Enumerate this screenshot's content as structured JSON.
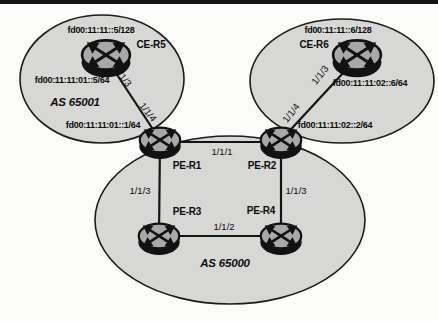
{
  "figure": {
    "type": "network-topology-diagram",
    "description_visible_text_only": true
  },
  "colors": {
    "zone_fill": "#d7d7d5",
    "zone_stroke": "#1b1b1b",
    "router_top_fill": "#a8a8a6",
    "router_base_fill": "#121212",
    "link_stroke": "#141414",
    "text": "#0c0c0c",
    "top_bar": "#141414",
    "background": "#fbfbfa"
  },
  "zones": {
    "as65001": {
      "label": "AS 65001"
    },
    "as65000": {
      "label": "AS 65000"
    }
  },
  "routers": {
    "ce_r5": "CE-R5",
    "ce_r6": "CE-R6",
    "pe_r1": "PE-R1",
    "pe_r2": "PE-R2",
    "pe_r3": "PE-R3",
    "pe_r4": "PE-R4"
  },
  "addresses": {
    "r5_loopback": "fd00:11:11::5/128",
    "r6_loopback": "fd00:11:11::6/128",
    "net65001_r5": "fd00:11:11:01::5/64",
    "net65001_r1": "fd00:11:11:01::1/64",
    "net65002_r6": "fd00:11:11:02::6/64",
    "net65002_r2": "fd00:11:11:02::2/64"
  },
  "interfaces": {
    "ce5_to_pe1": "1/1/3",
    "pe1_to_ce5": "1/1/4",
    "ce6_to_pe2": "1/1/3",
    "pe2_to_ce6": "1/1/4",
    "link_pe1_pe2": "1/1/1",
    "link_pe3_pe4": "1/1/2",
    "link_pe1_pe3": "1/1/3",
    "link_pe2_pe4": "1/1/3"
  }
}
